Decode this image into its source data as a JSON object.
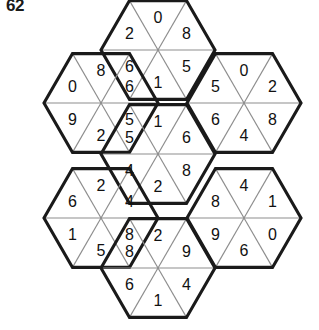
{
  "puzzle": {
    "label": "62",
    "type": "hexagon-triangle-number-puzzle",
    "layout": "flower-of-seven-hexagons",
    "geometry": {
      "hex_radius": 57,
      "hex_half_height": 49.4,
      "centers": {
        "top": {
          "cx": 158,
          "cy": 50
        },
        "upper_left": {
          "cx": 101,
          "cy": 103
        },
        "upper_right": {
          "cx": 244,
          "cy": 103
        },
        "center": {
          "cx": 158,
          "cy": 154
        },
        "lower_left": {
          "cx": 101,
          "cy": 218
        },
        "lower_right": {
          "cx": 244,
          "cy": 218
        },
        "bottom": {
          "cx": 158,
          "cy": 268
        }
      }
    },
    "cell_order": [
      "top",
      "upper_right",
      "lower_right",
      "bottom",
      "lower_left",
      "upper_left"
    ],
    "hexagons": [
      {
        "id": "hex-top",
        "name": "top",
        "cx": 158,
        "cy": 50,
        "values": {
          "top": "0",
          "upper_right": "8",
          "lower_right": "5",
          "bottom": "1",
          "lower_left": "6",
          "upper_left": "2"
        }
      },
      {
        "id": "hex-upper-left",
        "name": "upper-left",
        "cx": 101,
        "cy": 103,
        "values": {
          "top": "8",
          "upper_right": "6",
          "lower_right": "5",
          "bottom": "2",
          "lower_left": "9",
          "upper_left": "0"
        }
      },
      {
        "id": "hex-upper-right",
        "name": "upper-right",
        "cx": 244,
        "cy": 103,
        "values": {
          "top": "0",
          "upper_right": "2",
          "lower_right": "8",
          "bottom": "4",
          "lower_left": "6",
          "upper_left": "5"
        }
      },
      {
        "id": "hex-center",
        "name": "center",
        "cx": 158,
        "cy": 154,
        "values": {
          "top": "1",
          "upper_right": "6",
          "lower_right": "8",
          "bottom": "2",
          "lower_left": "4",
          "upper_left": "5"
        }
      },
      {
        "id": "hex-lower-left",
        "name": "lower-left",
        "cx": 101,
        "cy": 218,
        "values": {
          "top": "2",
          "upper_right": "4",
          "lower_right": "8",
          "bottom": "5",
          "lower_left": "1",
          "upper_left": "6"
        }
      },
      {
        "id": "hex-lower-right",
        "name": "lower-right",
        "cx": 244,
        "cy": 218,
        "values": {
          "top": "4",
          "upper_right": "1",
          "lower_right": "0",
          "bottom": "6",
          "lower_left": "9",
          "upper_left": "8"
        }
      },
      {
        "id": "hex-bottom",
        "name": "bottom",
        "cx": 158,
        "cy": 268,
        "values": {
          "top": "2",
          "upper_right": "9",
          "lower_right": "4",
          "bottom": "1",
          "lower_left": "6",
          "upper_left": "8"
        }
      }
    ],
    "colors": {
      "outline": "#1a1a1a",
      "spoke": "#8d8d8d",
      "fill": "#fdfdfd",
      "digit": "#111111",
      "label": "#1a1a1a",
      "background": "#ffffff"
    }
  }
}
